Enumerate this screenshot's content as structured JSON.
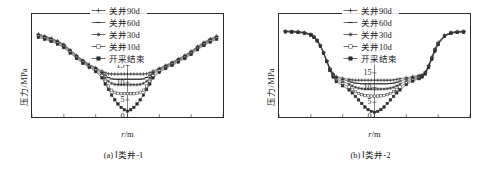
{
  "figure": {
    "panels": [
      {
        "id": "panel-a",
        "caption": "(a) Ⅰ类井-1",
        "ylabel": "压力/MPa",
        "xlabel_html": "r/m",
        "legend": [
          "关井90d",
          "关井60d",
          "关井30d",
          "关井10d",
          "开采结束"
        ],
        "chart_data": {
          "type": "line",
          "title": "(a) Ⅰ类井-1",
          "xlabel": "r/m",
          "ylabel": "压力/MPa",
          "xlim": [
            -600,
            600
          ],
          "ylim": [
            0,
            30
          ],
          "xticks": [
            -600,
            -400,
            -200,
            0,
            200,
            400,
            600
          ],
          "yticks": [
            0,
            5,
            10,
            15,
            20,
            25,
            30
          ],
          "grid": false,
          "legend_position": "top-center",
          "x": [
            -560,
            -520,
            -480,
            -440,
            -400,
            -360,
            -320,
            -280,
            -240,
            -200,
            -160,
            -140,
            -120,
            -100,
            -80,
            -60,
            -40,
            -20,
            0,
            20,
            40,
            60,
            80,
            100,
            120,
            140,
            160,
            200,
            240,
            280,
            320,
            360,
            400,
            440,
            480,
            520,
            560
          ],
          "series": [
            {
              "name": "关井90d",
              "marker": "cross",
              "values": [
                24.2,
                23.6,
                23.0,
                22.2,
                21.2,
                19.6,
                18.0,
                16.6,
                15.4,
                14.4,
                13.4,
                12.9,
                12.6,
                12.5,
                12.5,
                12.5,
                12.5,
                12.5,
                12.5,
                12.5,
                12.5,
                12.5,
                12.5,
                12.5,
                12.6,
                12.9,
                13.4,
                14.2,
                15.1,
                16.0,
                17.0,
                18.0,
                19.2,
                20.6,
                21.8,
                22.8,
                23.6
              ]
            },
            {
              "name": "关井60d",
              "marker": "dash",
              "values": [
                24.0,
                23.4,
                22.8,
                22.0,
                21.0,
                19.4,
                17.8,
                16.4,
                15.2,
                14.2,
                13.0,
                12.2,
                11.5,
                11.1,
                11.0,
                11.0,
                11.0,
                11.0,
                11.0,
                11.0,
                11.0,
                11.0,
                11.0,
                11.1,
                11.5,
                12.2,
                13.0,
                14.0,
                14.9,
                15.8,
                16.8,
                17.8,
                19.0,
                20.4,
                21.6,
                22.6,
                23.4
              ]
            },
            {
              "name": "关井30d",
              "marker": "star",
              "values": [
                23.8,
                23.2,
                22.6,
                21.8,
                20.8,
                19.2,
                17.6,
                16.2,
                15.0,
                14.0,
                12.6,
                11.4,
                10.4,
                9.8,
                9.5,
                9.4,
                9.4,
                9.4,
                9.4,
                9.4,
                9.4,
                9.4,
                9.5,
                9.8,
                10.4,
                11.4,
                12.6,
                13.8,
                14.7,
                15.6,
                16.6,
                17.6,
                18.8,
                20.2,
                21.4,
                22.4,
                23.2
              ]
            },
            {
              "name": "关井10d",
              "marker": "square",
              "values": [
                23.5,
                22.9,
                22.3,
                21.5,
                20.5,
                18.9,
                17.3,
                15.9,
                14.7,
                13.6,
                12.0,
                10.4,
                9.0,
                7.8,
                7.2,
                6.9,
                6.8,
                6.8,
                6.8,
                6.8,
                6.8,
                6.9,
                7.2,
                7.8,
                9.0,
                10.4,
                12.0,
                13.4,
                14.4,
                15.3,
                16.3,
                17.3,
                18.5,
                19.9,
                21.1,
                22.1,
                22.9
              ]
            },
            {
              "name": "开采结束",
              "marker": "square-filled",
              "values": [
                23.2,
                22.6,
                22.0,
                21.2,
                20.2,
                18.6,
                17.0,
                15.6,
                14.4,
                13.2,
                11.4,
                9.6,
                8.0,
                6.4,
                5.0,
                3.8,
                2.8,
                2.1,
                1.7,
                2.1,
                2.8,
                3.8,
                5.0,
                6.4,
                8.0,
                9.6,
                11.4,
                13.0,
                14.1,
                15.0,
                16.0,
                17.0,
                18.2,
                19.6,
                20.8,
                21.8,
                22.6
              ]
            }
          ]
        }
      },
      {
        "id": "panel-b",
        "caption": "(b) Ⅰ类井-2",
        "ylabel": "压力/MPa",
        "xlabel_html": "r/m",
        "legend": [
          "关井90d",
          "关井60d",
          "关井30d",
          "关井10d",
          "开采结束"
        ],
        "chart_data": {
          "type": "line",
          "title": "(b) Ⅰ类井-2",
          "xlabel": "r/m",
          "ylabel": "压力/MPa",
          "xlim": [
            -600,
            600
          ],
          "ylim": [
            0,
            35
          ],
          "xticks": [
            -600,
            -400,
            -200,
            0,
            200,
            400,
            600
          ],
          "yticks": [
            0,
            5,
            10,
            15,
            20,
            25,
            30,
            35
          ],
          "grid": false,
          "legend_position": "top-center",
          "x": [
            -560,
            -520,
            -480,
            -440,
            -400,
            -380,
            -360,
            -340,
            -320,
            -300,
            -280,
            -260,
            -240,
            -200,
            -160,
            -140,
            -120,
            -100,
            -80,
            -60,
            -40,
            -20,
            0,
            20,
            40,
            60,
            80,
            100,
            120,
            140,
            160,
            200,
            240,
            280,
            300,
            320,
            340,
            360,
            380,
            400,
            440,
            480,
            520,
            560
          ],
          "series": [
            {
              "name": "关井90d",
              "marker": "cross",
              "values": [
                29.2,
                29.2,
                29.1,
                28.8,
                28.2,
                27.4,
                26.2,
                24.4,
                22.0,
                19.2,
                16.6,
                14.8,
                13.8,
                13.2,
                12.8,
                12.6,
                12.5,
                12.5,
                12.5,
                12.5,
                12.5,
                12.5,
                12.5,
                12.5,
                12.5,
                12.5,
                12.5,
                12.5,
                12.6,
                12.8,
                13.0,
                13.4,
                13.8,
                14.2,
                14.4,
                15.4,
                17.6,
                20.4,
                23.2,
                25.4,
                27.8,
                28.8,
                29.1,
                29.2
              ]
            },
            {
              "name": "关井60d",
              "marker": "dash",
              "values": [
                29.2,
                29.1,
                29.0,
                28.7,
                28.1,
                27.3,
                26.1,
                24.3,
                21.9,
                19.1,
                16.4,
                14.5,
                13.4,
                12.7,
                12.2,
                11.8,
                11.5,
                11.4,
                11.3,
                11.3,
                11.3,
                11.3,
                11.3,
                11.3,
                11.3,
                11.3,
                11.3,
                11.4,
                11.5,
                11.8,
                12.2,
                12.9,
                13.4,
                13.9,
                14.2,
                15.2,
                17.4,
                20.2,
                23.0,
                25.2,
                27.7,
                28.7,
                29.0,
                29.1
              ]
            },
            {
              "name": "关井30d",
              "marker": "star",
              "values": [
                29.1,
                29.0,
                28.9,
                28.6,
                28.0,
                27.2,
                26.0,
                24.2,
                21.8,
                19.0,
                16.2,
                14.2,
                12.9,
                12.0,
                11.2,
                10.6,
                10.1,
                9.8,
                9.6,
                9.5,
                9.5,
                9.5,
                9.5,
                9.5,
                9.5,
                9.5,
                9.6,
                9.8,
                10.1,
                10.6,
                11.2,
                12.2,
                13.0,
                13.6,
                14.0,
                15.0,
                17.2,
                20.0,
                22.8,
                25.0,
                27.6,
                28.6,
                28.9,
                29.0
              ]
            },
            {
              "name": "关井10d",
              "marker": "square",
              "values": [
                29.0,
                28.9,
                28.8,
                28.5,
                27.9,
                27.1,
                25.9,
                24.1,
                21.7,
                18.9,
                16.0,
                13.9,
                12.4,
                11.3,
                10.2,
                9.4,
                8.6,
                8.0,
                7.6,
                7.3,
                7.2,
                7.1,
                7.1,
                7.1,
                7.2,
                7.3,
                7.6,
                8.0,
                8.6,
                9.4,
                10.2,
                11.6,
                12.6,
                13.3,
                13.8,
                14.8,
                17.0,
                19.8,
                22.6,
                24.8,
                27.5,
                28.5,
                28.8,
                28.9
              ]
            },
            {
              "name": "开采结束",
              "marker": "square-filled",
              "values": [
                28.9,
                28.8,
                28.7,
                28.4,
                27.8,
                27.0,
                25.8,
                24.0,
                21.6,
                18.8,
                15.8,
                13.6,
                12.0,
                10.6,
                9.2,
                8.2,
                7.0,
                5.8,
                4.6,
                3.4,
                2.5,
                1.9,
                1.6,
                1.9,
                2.5,
                3.4,
                4.6,
                5.8,
                7.0,
                8.2,
                9.2,
                11.0,
                12.2,
                13.0,
                13.6,
                14.6,
                16.8,
                19.6,
                22.4,
                24.6,
                27.4,
                28.4,
                28.7,
                28.8
              ]
            }
          ]
        }
      }
    ]
  }
}
